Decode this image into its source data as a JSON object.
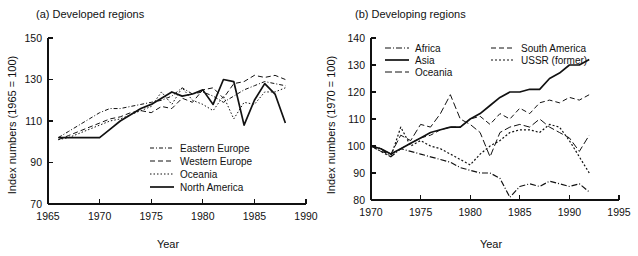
{
  "figure": {
    "width": 638,
    "height": 256,
    "background": "#ffffff",
    "ink_color": "#111111"
  },
  "chart_data": [
    {
      "type": "line",
      "title": "(a) Developed regions",
      "xlabel": "Year",
      "ylabel": "Index numbers (1965 = 100)",
      "xlim": [
        1965,
        1990
      ],
      "ylim": [
        70,
        150
      ],
      "xticks": [
        1965,
        1970,
        1975,
        1980,
        1985,
        1990
      ],
      "xticklabels": [
        "1965",
        "1970",
        "1975",
        "1980",
        "1985",
        "1990"
      ],
      "yticks": [
        70,
        90,
        110,
        130,
        150
      ],
      "yticklabels": [
        "70",
        "90",
        "110",
        "130",
        "150"
      ],
      "grid": false,
      "legend_position": "lower-right-inside",
      "series": [
        {
          "name": "Eastern Europe",
          "dash": "dash-dot",
          "style": "4,2,1,2",
          "width": 1.0,
          "x": [
            1966,
            1967,
            1968,
            1969,
            1970,
            1971,
            1972,
            1973,
            1974,
            1975,
            1976,
            1977,
            1978,
            1979,
            1980,
            1981,
            1982,
            1983,
            1984,
            1985,
            1986,
            1987,
            1988
          ],
          "values": [
            102,
            105,
            108,
            111,
            114,
            116,
            116,
            117,
            118,
            119,
            120,
            122,
            126,
            123,
            124,
            122,
            119,
            122,
            125,
            127,
            129,
            128,
            127
          ]
        },
        {
          "name": "Western Europe",
          "dash": "dashed",
          "style": "5,3",
          "width": 1.0,
          "x": [
            1966,
            1967,
            1968,
            1969,
            1970,
            1971,
            1972,
            1973,
            1974,
            1975,
            1976,
            1977,
            1978,
            1979,
            1980,
            1981,
            1982,
            1983,
            1984,
            1985,
            1986,
            1987,
            1988
          ],
          "values": [
            101,
            103,
            105,
            107,
            109,
            111,
            112,
            114,
            115,
            114,
            117,
            116,
            121,
            119,
            125,
            126,
            121,
            128,
            129,
            132,
            131,
            132,
            130
          ]
        },
        {
          "name": "Oceania",
          "dash": "dotted",
          "style": "1.5,2",
          "width": 1.0,
          "x": [
            1966,
            1967,
            1968,
            1969,
            1970,
            1971,
            1972,
            1973,
            1974,
            1975,
            1976,
            1977,
            1978,
            1979,
            1980,
            1981,
            1982,
            1983,
            1984,
            1985,
            1986,
            1987,
            1988
          ],
          "values": [
            101,
            102,
            104,
            106,
            108,
            110,
            111,
            113,
            115,
            117,
            124,
            118,
            126,
            120,
            118,
            115,
            122,
            111,
            119,
            118,
            124,
            124,
            126
          ]
        },
        {
          "name": "North America",
          "dash": "solid",
          "style": "none",
          "width": 1.7,
          "x": [
            1966,
            1967,
            1968,
            1969,
            1970,
            1971,
            1972,
            1973,
            1974,
            1975,
            1976,
            1977,
            1978,
            1979,
            1980,
            1981,
            1982,
            1983,
            1984,
            1985,
            1986,
            1987,
            1988
          ],
          "values": [
            102,
            102,
            102,
            102,
            102,
            106,
            110,
            113,
            116,
            118,
            121,
            124,
            122,
            123,
            125,
            118,
            130,
            129,
            108,
            120,
            128,
            123,
            109
          ]
        }
      ]
    },
    {
      "type": "line",
      "title": "(b) Developing regions",
      "xlabel": "Year",
      "ylabel": "Index numbers (1970 = 100)",
      "xlim": [
        1970,
        1995
      ],
      "ylim": [
        80,
        140
      ],
      "xticks": [
        1970,
        1975,
        1980,
        1985,
        1990,
        1995
      ],
      "xticklabels": [
        "1970",
        "1975",
        "1980",
        "1985",
        "1990",
        "1995"
      ],
      "yticks": [
        80,
        90,
        100,
        110,
        120,
        130,
        140
      ],
      "yticklabels": [
        "80",
        "90",
        "100",
        "110",
        "120",
        "130",
        "140"
      ],
      "grid": false,
      "legend_position": "upper-left-inside",
      "series": [
        {
          "name": "Africa",
          "dash": "dash-dot",
          "style": "6,2,1,2",
          "width": 1.2,
          "x": [
            1970,
            1971,
            1972,
            1973,
            1974,
            1975,
            1976,
            1977,
            1978,
            1979,
            1980,
            1981,
            1982,
            1983,
            1984,
            1985,
            1986,
            1987,
            1988,
            1989,
            1990,
            1991,
            1992
          ],
          "values": [
            100,
            99,
            96,
            99,
            98,
            97,
            96,
            95,
            94,
            92,
            91,
            90,
            90,
            88,
            81,
            85,
            86,
            85,
            87,
            86,
            85,
            86,
            83
          ]
        },
        {
          "name": "Asia",
          "dash": "solid",
          "style": "none",
          "width": 1.7,
          "x": [
            1970,
            1971,
            1972,
            1973,
            1974,
            1975,
            1976,
            1977,
            1978,
            1979,
            1980,
            1981,
            1982,
            1983,
            1984,
            1985,
            1986,
            1987,
            1988,
            1989,
            1990,
            1991,
            1992
          ],
          "values": [
            100,
            99,
            97,
            99,
            101,
            103,
            105,
            106,
            107,
            107,
            110,
            112,
            115,
            118,
            120,
            120,
            121,
            121,
            125,
            127,
            130,
            130,
            132
          ]
        },
        {
          "name": "Oceania",
          "dash": "long-dash",
          "style": "7,3",
          "width": 1.0,
          "x": [
            1970,
            1971,
            1972,
            1973,
            1974,
            1975,
            1976,
            1977,
            1978,
            1979,
            1980,
            1981,
            1982,
            1983,
            1984,
            1985,
            1986,
            1987,
            1988,
            1989,
            1990,
            1991,
            1992
          ],
          "values": [
            100,
            98,
            97,
            104,
            102,
            108,
            107,
            112,
            119,
            110,
            108,
            105,
            96,
            105,
            107,
            108,
            107,
            110,
            107,
            105,
            103,
            98,
            104
          ]
        },
        {
          "name": "South America",
          "dash": "dashed",
          "style": "5,3",
          "width": 1.0,
          "x": [
            1970,
            1971,
            1972,
            1973,
            1974,
            1975,
            1976,
            1977,
            1978,
            1979,
            1980,
            1981,
            1982,
            1983,
            1984,
            1985,
            1986,
            1987,
            1988,
            1989,
            1990,
            1991,
            1992
          ],
          "values": [
            100,
            99,
            97,
            99,
            101,
            103,
            104,
            106,
            107,
            107,
            110,
            111,
            108,
            112,
            110,
            114,
            112,
            116,
            117,
            116,
            118,
            117,
            119
          ]
        },
        {
          "name": "USSR (former)",
          "dash": "dotted",
          "style": "2,2",
          "width": 1.2,
          "x": [
            1970,
            1971,
            1972,
            1973,
            1974,
            1975,
            1976,
            1977,
            1978,
            1979,
            1980,
            1981,
            1982,
            1983,
            1984,
            1985,
            1986,
            1987,
            1988,
            1989,
            1990,
            1991,
            1992
          ],
          "values": [
            100,
            98,
            96,
            107,
            100,
            102,
            100,
            99,
            97,
            95,
            93,
            97,
            100,
            102,
            105,
            106,
            106,
            105,
            108,
            107,
            102,
            96,
            90
          ]
        }
      ]
    }
  ]
}
